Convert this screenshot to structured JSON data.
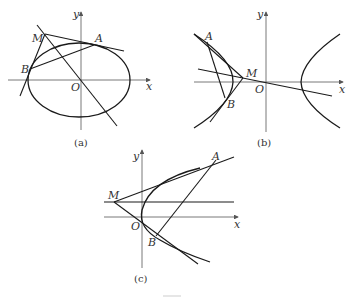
{
  "figure": {
    "caption": "",
    "panels": [
      {
        "id": "a",
        "caption": "(a)",
        "curve": "ellipse",
        "labels": {
          "x_axis": "x",
          "y_axis": "y",
          "origin": "O",
          "M": "M",
          "A": "A",
          "B": "B"
        },
        "description": "Ellipse centered at origin; point M outside with tangent lines MA and MB; chord AB; line through M and O."
      },
      {
        "id": "b",
        "caption": "(b)",
        "curve": "hyperbola",
        "labels": {
          "x_axis": "x",
          "y_axis": "y",
          "origin": "O",
          "M": "M",
          "A": "A",
          "B": "B"
        },
        "description": "Hyperbola with two branches; point M inside left branch region with tangents MA, MB to left branch; chord AB; line through M and O."
      },
      {
        "id": "c",
        "caption": "(c)",
        "curve": "parabola",
        "labels": {
          "x_axis": "x",
          "y_axis": "y",
          "origin": "O",
          "M": "M",
          "A": "A",
          "B": "B"
        },
        "description": "Parabola opening right with vertex at O; point M to the left with tangents MA and MB; chord AB; horizontal line through M."
      }
    ]
  },
  "colors": {
    "stroke": "#1a1a1a",
    "axis": "#555555",
    "text": "#333333",
    "background": "#ffffff"
  }
}
